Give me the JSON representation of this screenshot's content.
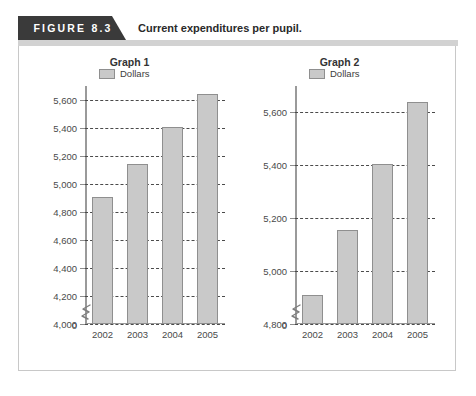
{
  "figure": {
    "tab_label": "FIGURE 8.3",
    "title": "Current expenditures per pupil."
  },
  "chart_data": [
    {
      "type": "bar",
      "title": "Graph 1",
      "categories": [
        "2002",
        "2003",
        "2004",
        "2005"
      ],
      "values": [
        4910,
        5140,
        5405,
        5640
      ],
      "series": [
        {
          "name": "Dollars",
          "values": [
            4910,
            5140,
            5405,
            5640
          ]
        }
      ],
      "legend": {
        "entries": [
          "Dollars"
        ],
        "position": "top-left"
      },
      "ylabel": "",
      "xlabel": "",
      "ylim": [
        4000,
        5700
      ],
      "yticks": [
        4000,
        4200,
        4400,
        4600,
        4800,
        5000,
        5200,
        5400,
        5600
      ],
      "ytick_labels": [
        "4,000",
        "4,200",
        "4,400",
        "4,600",
        "4,800",
        "5,000",
        "5,200",
        "5,400",
        "5,600"
      ],
      "zero_label": "0",
      "axis_break": true,
      "grid": true,
      "bar_color": "#c9c9c9",
      "bar_edge_color": "#8f8f8f"
    },
    {
      "type": "bar",
      "title": "Graph 2",
      "categories": [
        "2002",
        "2003",
        "2004",
        "2005"
      ],
      "values": [
        4910,
        5155,
        5405,
        5640
      ],
      "series": [
        {
          "name": "Dollars",
          "values": [
            4910,
            5155,
            5405,
            5640
          ]
        }
      ],
      "legend": {
        "entries": [
          "Dollars"
        ],
        "position": "top-left"
      },
      "ylabel": "",
      "xlabel": "",
      "ylim": [
        4800,
        5700
      ],
      "yticks": [
        4800,
        5000,
        5200,
        5400,
        5600
      ],
      "ytick_labels": [
        "4,800",
        "5,000",
        "5,200",
        "5,400",
        "5,600"
      ],
      "zero_label": "0",
      "axis_break": true,
      "grid": true,
      "bar_color": "#c9c9c9",
      "bar_edge_color": "#8f8f8f"
    }
  ]
}
